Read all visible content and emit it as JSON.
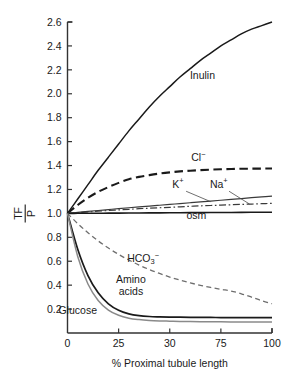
{
  "chart_data": {
    "type": "line",
    "title": "",
    "xlabel": "% Proximal tubule length",
    "ylabel_numerator": "TF",
    "ylabel_denominator": "P",
    "xlim": [
      0,
      100
    ],
    "ylim": [
      0,
      2.6
    ],
    "grid": false,
    "legend_position": "inline-curve-labels",
    "x_ticks": [
      {
        "value": 0,
        "label": "0"
      },
      {
        "value": 25,
        "label": "25"
      },
      {
        "value": 50,
        "label": "30"
      },
      {
        "value": 75,
        "label": "75"
      },
      {
        "value": 100,
        "label": "100"
      }
    ],
    "y_ticks": [
      {
        "value": 0.2,
        "label": "0.2"
      },
      {
        "value": 0.4,
        "label": "0.4"
      },
      {
        "value": 0.6,
        "label": "0.6"
      },
      {
        "value": 0.8,
        "label": "0.8"
      },
      {
        "value": 1.0,
        "label": "1.0"
      },
      {
        "value": 1.2,
        "label": "1.2"
      },
      {
        "value": 1.4,
        "label": "1.4"
      },
      {
        "value": 1.6,
        "label": "1.6"
      },
      {
        "value": 1.8,
        "label": "1.8"
      },
      {
        "value": 2.0,
        "label": "2.0"
      },
      {
        "value": 2.2,
        "label": "2.2"
      },
      {
        "value": 2.4,
        "label": "2.4"
      },
      {
        "value": 2.6,
        "label": "2.6"
      }
    ],
    "x": [
      0,
      5,
      10,
      15,
      20,
      25,
      30,
      35,
      40,
      45,
      50,
      55,
      60,
      65,
      70,
      75,
      80,
      85,
      90,
      95,
      100
    ],
    "series": [
      {
        "name": "Inulin",
        "label": "Inulin",
        "style": "solid",
        "color": "#1a1a1a",
        "width": 1.5,
        "values": [
          1.0,
          1.12,
          1.24,
          1.36,
          1.47,
          1.58,
          1.69,
          1.79,
          1.89,
          1.98,
          2.06,
          2.14,
          2.21,
          2.28,
          2.34,
          2.4,
          2.45,
          2.5,
          2.54,
          2.57,
          2.6
        ],
        "label_x": 66,
        "label_y": 2.12
      },
      {
        "name": "Chloride",
        "label": "Cl",
        "superscript": "−",
        "style": "dashed-long",
        "color": "#1a1a1a",
        "width": 2.1,
        "values": [
          1.0,
          1.07,
          1.13,
          1.18,
          1.22,
          1.255,
          1.285,
          1.305,
          1.32,
          1.333,
          1.343,
          1.351,
          1.357,
          1.362,
          1.366,
          1.369,
          1.371,
          1.373,
          1.374,
          1.3745,
          1.375
        ],
        "label_x": 64,
        "label_y": 1.44
      },
      {
        "name": "Potassium",
        "label": "K",
        "superscript": "+",
        "style": "solid",
        "color": "#3a3a3a",
        "width": 1.2,
        "values": [
          1.0,
          1.008,
          1.016,
          1.024,
          1.032,
          1.04,
          1.047,
          1.054,
          1.061,
          1.068,
          1.075,
          1.082,
          1.089,
          1.096,
          1.103,
          1.11,
          1.117,
          1.124,
          1.131,
          1.138,
          1.145
        ],
        "label_x": 54,
        "label_y": 1.215,
        "leader": {
          "from_x": 58,
          "from_y": 1.185,
          "to_x": 70,
          "to_y": 1.098
        }
      },
      {
        "name": "Sodium",
        "label": "Na",
        "superscript": "+",
        "style": "dash-dot",
        "color": "#3a3a3a",
        "width": 1.2,
        "values": [
          1.0,
          1.006,
          1.012,
          1.018,
          1.024,
          1.029,
          1.034,
          1.039,
          1.043,
          1.047,
          1.051,
          1.055,
          1.059,
          1.063,
          1.066,
          1.069,
          1.072,
          1.075,
          1.078,
          1.081,
          1.084
        ],
        "label_x": 74,
        "label_y": 1.215,
        "leader": {
          "from_x": 79,
          "from_y": 1.185,
          "to_x": 89,
          "to_y": 1.078
        }
      },
      {
        "name": "Osmolality",
        "label": "osm",
        "style": "solid",
        "color": "#1a1a1a",
        "width": 1.6,
        "values": [
          1.0,
          1.0005,
          1.001,
          1.0015,
          1.002,
          1.0025,
          1.003,
          1.0035,
          1.004,
          1.0045,
          1.005,
          1.0055,
          1.006,
          1.0065,
          1.007,
          1.0075,
          1.008,
          1.0085,
          1.009,
          1.0095,
          1.01
        ],
        "label_x": 63,
        "label_y": 0.955
      },
      {
        "name": "Bicarbonate",
        "label": "HCO",
        "subscript": "3",
        "superscript": "−",
        "style": "dashed",
        "color": "#6e6e6e",
        "width": 1.3,
        "values": [
          1.0,
          0.915,
          0.838,
          0.77,
          0.71,
          0.657,
          0.61,
          0.568,
          0.531,
          0.498,
          0.468,
          0.442,
          0.419,
          0.399,
          0.381,
          0.365,
          0.351,
          0.328,
          0.3,
          0.27,
          0.245
        ],
        "label_x": 37,
        "label_y": 0.595
      },
      {
        "name": "Amino acids",
        "label_line1": "Amino",
        "label_line2": "acids",
        "style": "solid",
        "color": "#1a1a1a",
        "width": 1.7,
        "values": [
          1.0,
          0.7,
          0.48,
          0.336,
          0.244,
          0.19,
          0.16,
          0.145,
          0.138,
          0.135,
          0.133,
          0.132,
          0.131,
          0.13,
          0.13,
          0.129,
          0.129,
          0.129,
          0.128,
          0.128,
          0.128
        ],
        "label_x": 31,
        "label_y": 0.415
      },
      {
        "name": "Glucose",
        "label": "Glucose",
        "style": "solid",
        "color": "#8a8a8a",
        "width": 1.5,
        "values": [
          1.0,
          0.64,
          0.41,
          0.272,
          0.192,
          0.148,
          0.124,
          0.112,
          0.105,
          0.101,
          0.099,
          0.097,
          0.096,
          0.095,
          0.094,
          0.094,
          0.093,
          0.093,
          0.092,
          0.092,
          0.092
        ],
        "label_x": 5,
        "label_y": 0.155
      }
    ]
  },
  "colors": {
    "axis": "#333333",
    "text": "#1a1a1a",
    "background": "#ffffff",
    "muted_curve": "#6e6e6e",
    "light_curve": "#8a8a8a"
  }
}
